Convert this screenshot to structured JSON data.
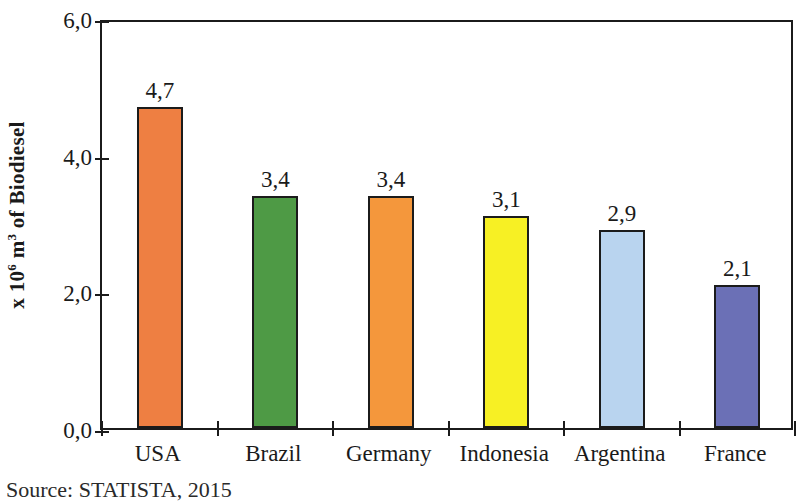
{
  "chart_data": {
    "type": "bar",
    "title": "",
    "subtitle": "",
    "xlabel": "",
    "ylabel": "x 10⁶ m³ of Biodiesel",
    "ylabel_parts": {
      "prefix": "x 10",
      "exp1": "6",
      "mid": " m",
      "exp2": "3",
      "suffix": " of Biodiesel"
    },
    "categories": [
      "USA",
      "Brazil",
      "Germany",
      "Indonesia",
      "Argentina",
      "France"
    ],
    "values": [
      4.7,
      3.4,
      3.4,
      3.1,
      2.9,
      2.1
    ],
    "value_labels": [
      "4,7",
      "3,4",
      "3,4",
      "3,1",
      "2,9",
      "2,1"
    ],
    "bar_colors": [
      "#EE7F42",
      "#4E9A45",
      "#F4973C",
      "#F7F024",
      "#B9D4EF",
      "#6B70B6"
    ],
    "bar_border_color": "#1b1b1b",
    "ylim": [
      0,
      6
    ],
    "ytick_values": [
      0,
      2,
      4,
      6
    ],
    "ytick_labels": [
      "0,0",
      "2,0",
      "4,0",
      "6,0"
    ],
    "decimal_separator": ",",
    "grid": false,
    "legend": false,
    "frame": true,
    "axis_color": "#1b1b1b"
  },
  "source": {
    "text": "Source: STATISTA, 2015"
  }
}
